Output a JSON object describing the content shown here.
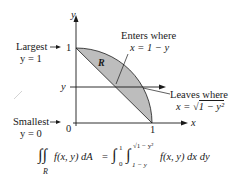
{
  "figure": {
    "axes": {
      "x_label": "x",
      "y_label": "y",
      "origin_label": "0",
      "x_tick": "1",
      "y_tick": "1",
      "y_line_label": "y"
    },
    "region_label": "R",
    "annotations": {
      "largest": {
        "line1": "Largest",
        "line2": "y = 1"
      },
      "smallest": {
        "line1": "Smallest",
        "line2": "y = 0"
      },
      "enters": {
        "line1": "Enters where",
        "line2": "x = 1 − y"
      },
      "leaves": {
        "line1": "Leaves where",
        "line2_prefix": "x = ",
        "line2_radicand": "1 − y²"
      }
    },
    "formula": {
      "lhs": "f(x, y) dA",
      "lhs_sub": "R",
      "equals": "=",
      "outer_upper": "1",
      "outer_lower": "0",
      "inner_upper": "√1 − y²",
      "inner_lower": "1 − y",
      "integrand": "f(x, y) dx dy"
    },
    "colors": {
      "region_fill": "#bdbdbd",
      "stroke": "#1a1a1a"
    }
  }
}
